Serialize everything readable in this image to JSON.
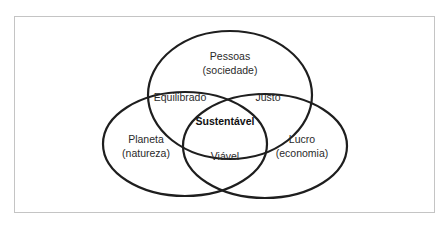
{
  "diagram": {
    "type": "venn",
    "sets": [
      {
        "id": "pessoas",
        "title": "Pessoas",
        "subtitle": "(sociedade)"
      },
      {
        "id": "planeta",
        "title": "Planeta",
        "subtitle": "(natureza)"
      },
      {
        "id": "lucro",
        "title": "Lucro",
        "subtitle": "(economia)"
      }
    ],
    "intersections": {
      "pessoas_planeta": "Equilibrado",
      "pessoas_lucro": "Justo",
      "planeta_lucro": "Viável",
      "center": "Sustentável"
    },
    "colors": {
      "stroke": "#1e1e1e",
      "text": "#2a2a2a",
      "frame": "#c4c4c4",
      "background": "#ffffff"
    }
  }
}
